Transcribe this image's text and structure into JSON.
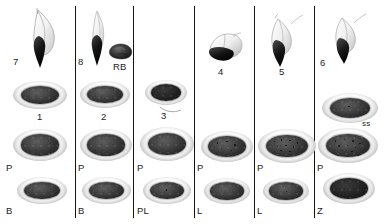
{
  "figure": {
    "type": "micrograph-plate",
    "background_color": "#ffffff",
    "ink_color": "#1b1b1b",
    "columns": 6,
    "rows": 4
  },
  "columns": [
    {
      "index": 1,
      "top": {
        "label": "7",
        "kind": "flagellate"
      },
      "row_numbered": {
        "label": "1",
        "kind": "oval"
      },
      "row_p": {
        "label": "P",
        "kind": "oval"
      },
      "row_bottom": {
        "label": "B",
        "kind": "oval"
      }
    },
    {
      "index": 2,
      "top": {
        "label": "8",
        "kind": "flagellate",
        "extra_label": "RB",
        "extra_kind": "residual-body"
      },
      "row_numbered": {
        "label": "2",
        "kind": "oval"
      },
      "row_p": {
        "label": "P",
        "kind": "oval"
      },
      "row_bottom": {
        "label": "B",
        "kind": "oval"
      }
    },
    {
      "index": 3,
      "top": {
        "label": "",
        "kind": "empty"
      },
      "row_numbered": {
        "label": "3",
        "kind": "oval"
      },
      "row_p": {
        "label": "P",
        "kind": "oval"
      },
      "row_bottom": {
        "label": "PL",
        "kind": "oval"
      }
    },
    {
      "index": 4,
      "top": {
        "label": "4",
        "kind": "flagellate-tilted"
      },
      "row_numbered": {
        "label": "",
        "kind": "empty"
      },
      "row_p": {
        "label": "P",
        "kind": "oval"
      },
      "row_bottom": {
        "label": "L",
        "kind": "oval"
      }
    },
    {
      "index": 5,
      "top": {
        "label": "5",
        "kind": "flagellate"
      },
      "row_numbered": {
        "label": "",
        "kind": "empty"
      },
      "row_p": {
        "label": "P",
        "kind": "oval"
      },
      "row_bottom": {
        "label": "L",
        "kind": "oval"
      }
    },
    {
      "index": 6,
      "top": {
        "label": "6",
        "kind": "flagellate"
      },
      "row_numbered": {
        "label": "ss",
        "kind": "oval"
      },
      "row_p": {
        "label": "P",
        "kind": "oval"
      },
      "row_bottom": {
        "label": "Z",
        "kind": "oval"
      }
    }
  ],
  "labels": {
    "n1": "1",
    "n2": "2",
    "n3": "3",
    "n4": "4",
    "n5": "5",
    "n6": "6",
    "n7": "7",
    "n8": "8",
    "rb": "RB",
    "ss": "ss",
    "p1": "P",
    "p2": "P",
    "p3": "P",
    "p4": "P",
    "p5": "P",
    "p6": "P",
    "b1": "B",
    "b2": "B",
    "pl": "PL",
    "l4": "L",
    "l5": "L",
    "z": "Z"
  }
}
